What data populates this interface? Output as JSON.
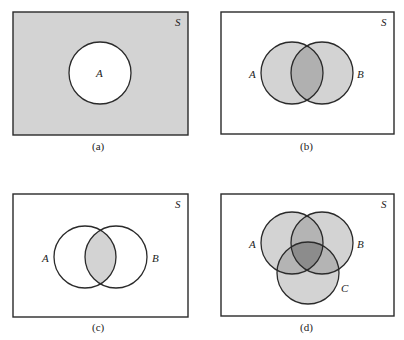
{
  "figure": {
    "panels": [
      {
        "id": "a",
        "caption": "(a)",
        "universe_label": "S",
        "sets": [
          {
            "label": "A"
          }
        ],
        "shaded_region": "complement of A"
      },
      {
        "id": "b",
        "caption": "(b)",
        "universe_label": "S",
        "sets": [
          {
            "label": "A"
          },
          {
            "label": "B"
          }
        ],
        "shaded_region": "A union B (intersection darker)"
      },
      {
        "id": "c",
        "caption": "(c)",
        "universe_label": "S",
        "sets": [
          {
            "label": "A"
          },
          {
            "label": "B"
          }
        ],
        "shaded_region": "A intersect B"
      },
      {
        "id": "d",
        "caption": "(d)",
        "universe_label": "S",
        "sets": [
          {
            "label": "A"
          },
          {
            "label": "B"
          },
          {
            "label": "C"
          }
        ],
        "shaded_region": "A union B union C (overlaps darker)"
      }
    ],
    "colors": {
      "background": "#ffffff",
      "stroke": "#2a2a2a",
      "light_fill": "#d3d3d3",
      "mid_fill": "#b4b4b4",
      "dark_fill": "#979797",
      "darkest_fill": "#838383"
    }
  }
}
